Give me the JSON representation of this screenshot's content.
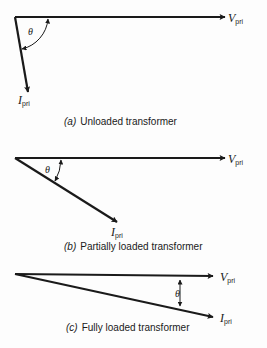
{
  "colors": {
    "ink": "#1a1a1a",
    "background": "#fdfdfd"
  },
  "diagrams": [
    {
      "id": "a",
      "caption_tag": "(a)",
      "caption_text": "Unloaded transformer",
      "voltage_label": {
        "main": "V",
        "sub": "pri"
      },
      "current_label": {
        "main": "I",
        "sub": "pri"
      },
      "angle_label": "θ",
      "angle_deg": 80
    },
    {
      "id": "b",
      "caption_tag": "(b)",
      "caption_text": "Partially loaded transformer",
      "voltage_label": {
        "main": "V",
        "sub": "pri"
      },
      "current_label": {
        "main": "I",
        "sub": "pri"
      },
      "angle_label": "θ",
      "angle_deg": 31
    },
    {
      "id": "c",
      "caption_tag": "(c)",
      "caption_text": "Fully loaded transformer",
      "voltage_label": {
        "main": "V",
        "sub": "pri"
      },
      "current_label": {
        "main": "I",
        "sub": "pri"
      },
      "angle_label": "θ",
      "angle_deg": 11
    }
  ]
}
